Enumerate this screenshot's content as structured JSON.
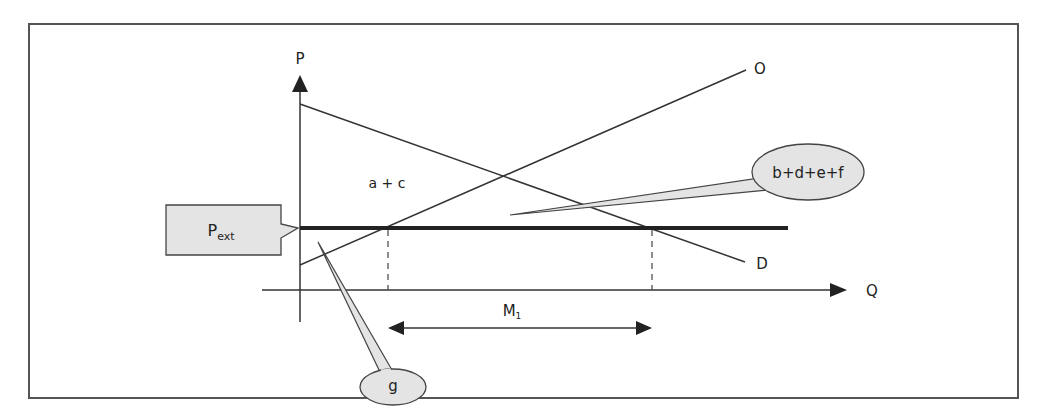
{
  "diagram": {
    "type": "economics-supply-demand-import",
    "axes": {
      "y_label": "P",
      "x_label": "Q"
    },
    "curves": {
      "demand_label": "D",
      "supply_label": "O"
    },
    "price_line": {
      "label_main": "P",
      "label_sub": "ext"
    },
    "area_label": "a + c",
    "imports": {
      "label_main": "M",
      "label_sub": "1"
    },
    "callouts": {
      "welfare_gain": "b+d+e+f",
      "producer_area": "g"
    },
    "colors": {
      "line": "#333333",
      "thick_line": "#222222",
      "callout_fill": "#e4e4e4",
      "frame": "#555555"
    }
  }
}
